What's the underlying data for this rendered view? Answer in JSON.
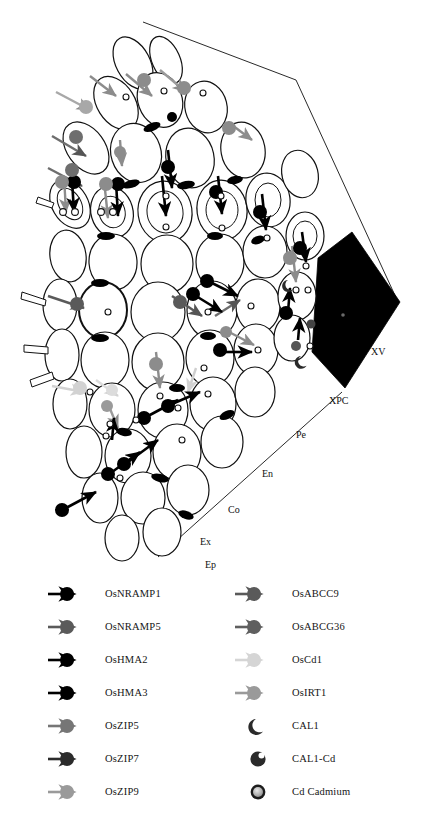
{
  "figure": {
    "background_color": "#ffffff",
    "outline_color": "#111111"
  },
  "tissue_labels": [
    {
      "id": "Ep",
      "text": "Ep",
      "full_name": "Epidermis",
      "x": 205,
      "y": 568
    },
    {
      "id": "Ex",
      "text": "Ex",
      "full_name": "Exodermis",
      "x": 200,
      "y": 545
    },
    {
      "id": "Co",
      "text": "Co",
      "full_name": "Cortex",
      "x": 228,
      "y": 513
    },
    {
      "id": "En",
      "text": "En",
      "full_name": "Endodermis",
      "x": 262,
      "y": 477
    },
    {
      "id": "Pe",
      "text": "Pe",
      "full_name": "Pericycle",
      "x": 296,
      "y": 438
    },
    {
      "id": "XPC",
      "text": "XPC",
      "full_name": "Xylem parenchyma cell",
      "x": 329,
      "y": 404
    },
    {
      "id": "XV",
      "text": "XV",
      "full_name": "Xylem vessel",
      "x": 371,
      "y": 355
    }
  ],
  "colors": {
    "black": "#000000",
    "dark_grey": "#4d4d4d",
    "mid_grey": "#6e6e6e",
    "grey": "#8c8c8c",
    "light_grey": "#a8a8a8",
    "pale_grey": "#cfcfcf",
    "very_pale_grey": "#dcdcdc",
    "cell_fill": "#ffffff",
    "xylem_fill": "#000000"
  },
  "legend": {
    "columns": [
      {
        "column_index": 0,
        "x_glyph": 48,
        "x_text": 105,
        "items": [
          {
            "label": "OsNRAMP1",
            "glyph": "arrow-with-circle",
            "color": "#000000",
            "y": 594
          },
          {
            "label": "OsNRAMP5",
            "glyph": "arrow-with-circle",
            "color": "#5a5a5a",
            "y": 627
          },
          {
            "label": "OsHMA2",
            "glyph": "arrow-with-circle",
            "color": "#000000",
            "y": 660
          },
          {
            "label": "OsHMA3",
            "glyph": "arrow-with-circle",
            "color": "#000000",
            "y": 693
          },
          {
            "label": "OsZIP5",
            "glyph": "arrow-with-circle",
            "color": "#767676",
            "y": 726
          },
          {
            "label": "OsZIP7",
            "glyph": "arrow-with-circle",
            "color": "#2b2b2b",
            "y": 759
          },
          {
            "label": "OsZIP9",
            "glyph": "arrow-with-circle",
            "color": "#9a9a9a",
            "y": 792
          }
        ]
      },
      {
        "column_index": 1,
        "x_glyph": 235,
        "x_text": 292,
        "items": [
          {
            "label": "OsABCC9",
            "glyph": "arrow-with-circle",
            "color": "#5a5a5a",
            "y": 594
          },
          {
            "label": "OsABCG36",
            "glyph": "arrow-with-circle",
            "color": "#5f5f5f",
            "y": 627
          },
          {
            "label": "OsCd1",
            "glyph": "arrow-with-circle",
            "color": "#d5d5d5",
            "y": 660
          },
          {
            "label": "OsIRT1",
            "glyph": "arrow-with-circle",
            "color": "#9a9a9a",
            "y": 693
          },
          {
            "label": "CAL1",
            "glyph": "crescent",
            "color": "#2a2a2a",
            "y": 726
          },
          {
            "label": "CAL1-Cd",
            "glyph": "crescent-with-dot",
            "color": "#2a2a2a",
            "y": 759
          },
          {
            "label": "Cd Cadmium",
            "glyph": "cd-ring",
            "color": "#2a2a2a",
            "y": 792
          }
        ]
      }
    ]
  }
}
